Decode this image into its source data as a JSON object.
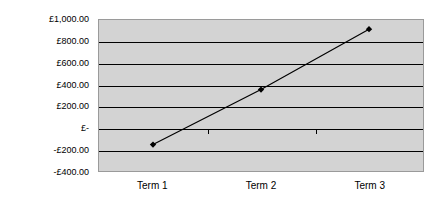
{
  "chart_data": {
    "type": "line",
    "title": "",
    "subtitle": "",
    "xlabel": "",
    "ylabel": "",
    "categories": [
      "Term 1",
      "Term 2",
      "Term 3"
    ],
    "series": [
      {
        "name": "Cumulative Cash Flow",
        "values": [
          -155,
          355,
          915
        ],
        "marker": "diamond",
        "color": "#000000"
      }
    ],
    "ylim": [
      -400,
      1000
    ],
    "ytick_values": [
      1000,
      800,
      600,
      400,
      200,
      0,
      -200,
      -400
    ],
    "ytick_labels": [
      "£1,000.00",
      "£800.00",
      "£600.00",
      "£400.00",
      "£200.00",
      "£-",
      "-£200.00",
      "-£400.00"
    ],
    "grid": true,
    "gridlines_horizontal": true,
    "gridlines_vertical": false,
    "legend": false,
    "legend_position": "none",
    "plot_background": "#d3d3d3",
    "figure_background": "#ffffff",
    "axis_color": "#000000",
    "currency": "GBP",
    "annotations": []
  }
}
